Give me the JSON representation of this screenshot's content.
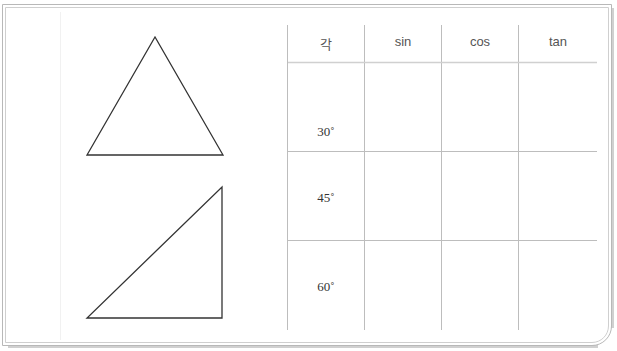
{
  "figures": {
    "equilateral_triangle": {
      "points": [
        [
          155,
          37
        ],
        [
          87,
          155
        ],
        [
          223,
          155
        ]
      ]
    },
    "right_triangle": {
      "points": [
        [
          87,
          318
        ],
        [
          222,
          318
        ],
        [
          222,
          187
        ]
      ]
    }
  },
  "table": {
    "headers": [
      "각",
      "sin",
      "cos",
      "tan"
    ],
    "rows": [
      {
        "angle": "30˚",
        "sin": "",
        "cos": "",
        "tan": ""
      },
      {
        "angle": "45˚",
        "sin": "",
        "cos": "",
        "tan": ""
      },
      {
        "angle": "60˚",
        "sin": "",
        "cos": "",
        "tan": ""
      }
    ]
  },
  "colors": {
    "frame": "#b8b8b8",
    "grid": "#bdbdbd",
    "shape_stroke": "#333333"
  }
}
